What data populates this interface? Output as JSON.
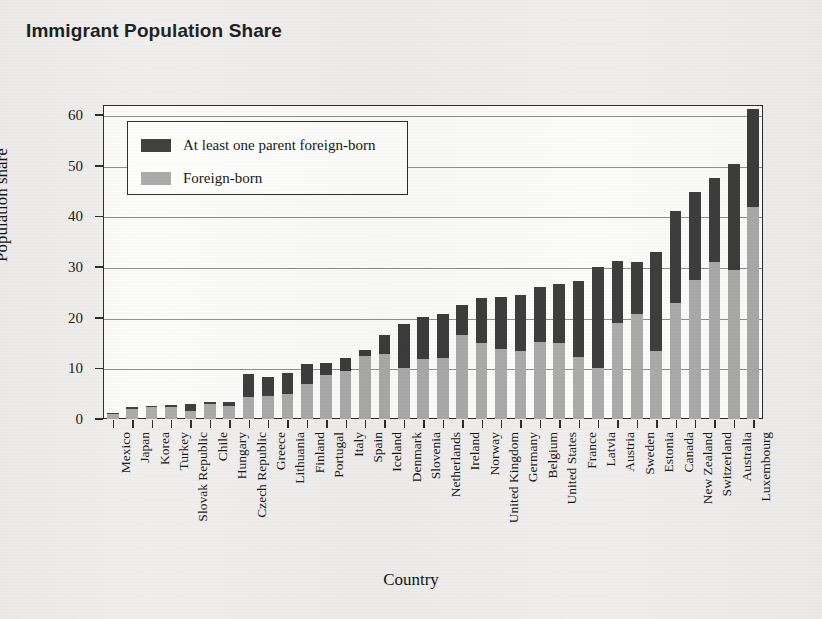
{
  "chart_data": {
    "type": "bar",
    "subtype": "stacked-bar",
    "title": "Immigrant Population Share",
    "xlabel": "Country",
    "ylabel": "Population share",
    "ylim": [
      0,
      62
    ],
    "yticks": [
      0,
      10,
      20,
      30,
      40,
      50,
      60
    ],
    "grid": true,
    "legend_position": "upper left inside",
    "colors": {
      "foreign_born": "#a9a9a9",
      "at_least_one_parent_foreign_born": "#3b3b3b",
      "frame": "#2a2a2a",
      "background": "#efeeec",
      "plot_background": "#fbfbfa"
    },
    "categories": [
      "Mexico",
      "Japan",
      "Korea",
      "Turkey",
      "Slovak Republic",
      "Chile",
      "Hungary",
      "Czech Republic",
      "Greece",
      "Lithuania",
      "Finland",
      "Portugal",
      "Italy",
      "Spain",
      "Iceland",
      "Denmark",
      "Slovenia",
      "Netherlands",
      "Ireland",
      "Norway",
      "United Kingdom",
      "Germany",
      "Belgium",
      "United States",
      "France",
      "Latvia",
      "Austria",
      "Sweden",
      "Estonia",
      "Canada",
      "New Zealand",
      "Switzerland",
      "Australia",
      "Luxembourg"
    ],
    "series": [
      {
        "name": "Foreign-born",
        "color": "#a9a9a9",
        "values": [
          0.9,
          2.0,
          2.3,
          2.4,
          1.6,
          3.0,
          2.6,
          4.3,
          4.5,
          5.0,
          6.9,
          8.7,
          9.5,
          12.5,
          12.8,
          10.0,
          11.8,
          12.0,
          16.5,
          15.0,
          13.8,
          13.5,
          15.2,
          15.0,
          12.2,
          10.0,
          19.0,
          20.7,
          13.5,
          23.0,
          27.5,
          31.0,
          29.5,
          41.8
        ]
      },
      {
        "name": "At least one parent foreign-born",
        "color": "#3b3b3b",
        "values": [
          0.2,
          0.3,
          0.3,
          0.3,
          1.4,
          0.3,
          0.7,
          4.6,
          3.8,
          4.0,
          3.9,
          2.4,
          2.5,
          1.1,
          3.8,
          8.8,
          8.3,
          8.8,
          6.0,
          8.8,
          10.2,
          11.0,
          10.8,
          11.7,
          15.1,
          20.0,
          12.2,
          10.3,
          19.5,
          18.0,
          17.3,
          16.5,
          20.8,
          19.5
        ]
      }
    ],
    "totals": [
      1.1,
      2.3,
      2.6,
      2.7,
      3.0,
      3.3,
      3.3,
      8.9,
      8.3,
      9.0,
      10.8,
      11.1,
      12.0,
      13.6,
      16.6,
      18.8,
      20.1,
      20.8,
      22.5,
      23.8,
      24.0,
      24.5,
      26.0,
      26.7,
      27.3,
      30.0,
      31.2,
      31.0,
      33.0,
      41.0,
      44.8,
      47.5,
      50.3,
      61.3
    ]
  },
  "legend": {
    "entries": [
      {
        "label": "At least one parent foreign-born",
        "swatch": "#3b3b3b"
      },
      {
        "label": "Foreign-born",
        "swatch": "#a9a9a9"
      }
    ]
  }
}
